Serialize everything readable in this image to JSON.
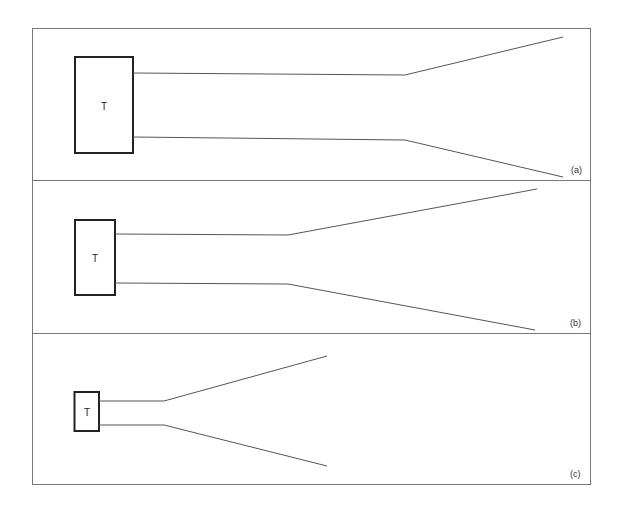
{
  "figure": {
    "panels": [
      {
        "id": "a",
        "label": "(a)",
        "box_label": "T"
      },
      {
        "id": "b",
        "label": "(b)",
        "box_label": "T"
      },
      {
        "id": "c",
        "label": "(c)",
        "box_label": "T"
      }
    ]
  }
}
